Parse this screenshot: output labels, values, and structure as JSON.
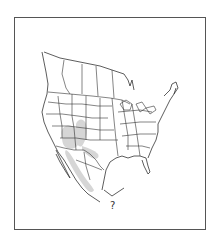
{
  "figure": {
    "type": "range-map",
    "region": "North America (Canada, United States, Mexico)",
    "frame_color": "#555555",
    "border_color": "#333333",
    "range_fill_color": "#d6d6d6",
    "range_description": "Shaded range across Arizona, New Mexico, southern Colorado/Utah, west Texas and western Mexico (Sierra Madre Occidental)",
    "label": "?"
  }
}
